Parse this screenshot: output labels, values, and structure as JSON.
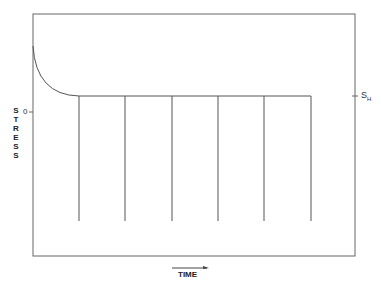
{
  "diagram": {
    "y_axis_label": "STRESS",
    "y_axis_letters": [
      "S",
      "T",
      "R",
      "E",
      "S",
      "S"
    ],
    "zero_label": "0",
    "right_label_main": "S",
    "right_label_sub": "H",
    "x_axis_label": "TIME",
    "x_axis_arrow": "right",
    "vertical_lines_count": 6,
    "line_color": "#555555"
  }
}
